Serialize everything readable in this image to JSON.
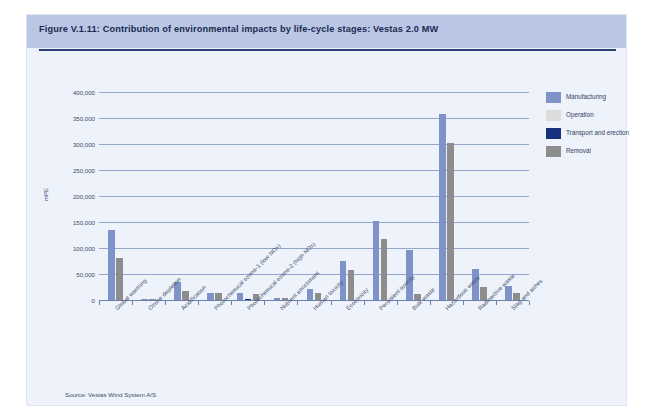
{
  "figure": {
    "title": "Figure V.1.11: Contribution of environmental impacts by life-cycle stages: Vestas 2.0 MW",
    "source": "Source: Vestas Wind System A/S"
  },
  "colors": {
    "manufacturing": "#7f93c9",
    "operation": "#dcdcdc",
    "transport": "#17317f",
    "removal": "#8d8d8d",
    "title_band": "#b9c7e4",
    "panel_bg": "#eef2fa",
    "gridline": "#93a6cd",
    "title_rule": "#2b3f77"
  },
  "legend": {
    "position": "right",
    "items": [
      {
        "label": "Manufacturing",
        "color": "#7f93c9",
        "key": "manufacturing"
      },
      {
        "label": "Operation",
        "color": "#dcdcdc",
        "key": "operation"
      },
      {
        "label": "Transport and erection",
        "color": "#17317f",
        "key": "transport"
      },
      {
        "label": "Removal",
        "color": "#8d8d8d",
        "key": "removal"
      }
    ]
  },
  "chart_data": {
    "type": "bar",
    "title": "Contribution of environmental impacts by life-cycle stages: Vestas 2.0 MW",
    "xlabel": "",
    "ylabel": "mPE",
    "ylim": [
      0,
      400000
    ],
    "ytick_labels": [
      "400,000",
      "350,000",
      "300,000",
      "250,000",
      "200,000",
      "150,000",
      "100,000",
      "50,000",
      "0"
    ],
    "ytick_values": [
      400000,
      350000,
      300000,
      250000,
      200000,
      150000,
      100000,
      50000,
      0
    ],
    "grid": true,
    "grouping": "grouped",
    "categories": [
      "Global warming",
      "Ozone depletion",
      "Acidification",
      "Photochemical ozone-1 (low NOx)",
      "Photochemical ozone-2 (high NOx)",
      "Nutrient enrichment",
      "Human toxicity",
      "Ecotoxicity",
      "Persistent toxicity",
      "Bulk waste",
      "Hazardous waste",
      "Radioactive waste",
      "Slag and ashes"
    ],
    "series": [
      {
        "name": "Manufacturing",
        "color": "#7f93c9",
        "values": [
          135000,
          1000,
          35000,
          14000,
          13000,
          4000,
          22000,
          75000,
          152000,
          97000,
          357000,
          60000,
          27000
        ]
      },
      {
        "name": "Operation",
        "color": "#dcdcdc",
        "values": [
          0,
          0,
          0,
          0,
          0,
          0,
          0,
          0,
          0,
          0,
          0,
          0,
          0
        ]
      },
      {
        "name": "Transport and erection",
        "color": "#17317f",
        "values": [
          0,
          0,
          0,
          0,
          2000,
          0,
          0,
          0,
          0,
          0,
          0,
          0,
          0
        ]
      },
      {
        "name": "Removal",
        "color": "#8d8d8d",
        "values": [
          80000,
          500,
          18000,
          14000,
          11000,
          3000,
          13000,
          58000,
          118000,
          11000,
          302000,
          25000,
          13000
        ]
      }
    ]
  }
}
